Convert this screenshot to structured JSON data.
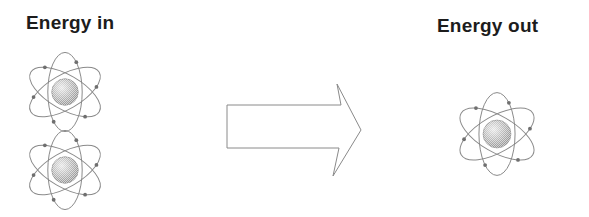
{
  "diagram": {
    "background_color": "#ffffff",
    "labels": {
      "energy_in": "Energy in",
      "energy_out": "Energy out"
    },
    "label_color": "#1c1c1c",
    "stroke_color": "#8a8a8a",
    "nucleus_color": "#9a9a9a",
    "nucleus_highlight": "#e8e8e8",
    "arrow": {
      "name": "right-block-arrow",
      "direction": "right",
      "fill": "#ffffff",
      "stroke": "#8a8a8a"
    },
    "atoms": [
      {
        "id": "atom-in-1",
        "side": "left",
        "orbits": 3,
        "electrons": 6
      },
      {
        "id": "atom-in-2",
        "side": "left",
        "orbits": 3,
        "electrons": 6
      },
      {
        "id": "atom-out-1",
        "side": "right",
        "orbits": 3,
        "electrons": 6
      }
    ]
  },
  "chart_data": {
    "type": "diagram",
    "nodes": [
      {
        "label": "Energy in",
        "count": 2,
        "symbol": "atom"
      },
      {
        "label": "Energy out",
        "count": 1,
        "symbol": "atom"
      }
    ],
    "edges": [
      {
        "from": "Energy in",
        "to": "Energy out",
        "symbol": "arrow-right"
      }
    ]
  }
}
